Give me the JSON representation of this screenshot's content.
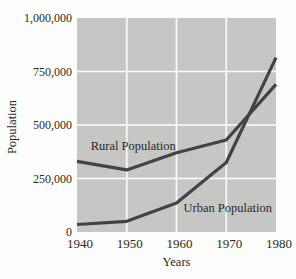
{
  "chart_data": {
    "type": "line",
    "title": "",
    "xlabel": "Years",
    "ylabel": "Population",
    "x": [
      1940,
      1950,
      1960,
      1970,
      1980
    ],
    "x_tick_labels": [
      "1940",
      "1950",
      "1960",
      "1970",
      "1980"
    ],
    "y_ticks": [
      0,
      250000,
      500000,
      750000,
      1000000
    ],
    "y_tick_labels": [
      "0",
      "250,000",
      "500,000",
      "750,000",
      "1,000,000"
    ],
    "ylim": [
      0,
      1000000
    ],
    "xlim": [
      1940,
      1980
    ],
    "grid": true,
    "legend_position": "inline-annotations",
    "series": [
      {
        "name": "Rural Population",
        "values": [
          330000,
          290000,
          370000,
          430000,
          690000
        ]
      },
      {
        "name": "Urban Population",
        "values": [
          35000,
          50000,
          135000,
          325000,
          815000
        ]
      }
    ],
    "annotations": [
      {
        "name": "rural-population-label",
        "text": "Rural Population",
        "x": 1951.3,
        "y": 400000
      },
      {
        "name": "urban-population-label",
        "text": "Urban Population",
        "x": 1970.3,
        "y": 110000
      }
    ],
    "colors": {
      "page_background": "#fdfdfb",
      "plot_background": "#c6c6c5",
      "gridline": "#fbfbfa",
      "line": "#414348",
      "text": "#2d2a28"
    }
  }
}
